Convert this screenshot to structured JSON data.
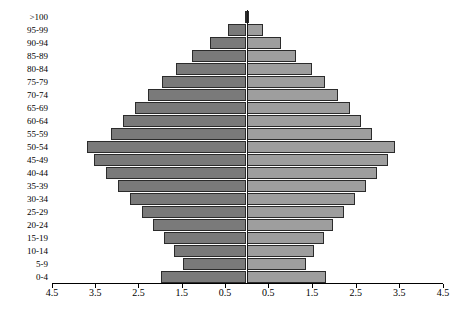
{
  "chart_data": {
    "type": "bar",
    "subtype": "population-pyramid",
    "title": "",
    "xlabel": "",
    "ylabel": "",
    "orientation": "horizontal",
    "grid": false,
    "legend": null,
    "axis": {
      "center_value": 0,
      "half_range": 4.5,
      "xticks_left": [
        "4.5",
        "3.5",
        "2.5",
        "1.5",
        "0.5"
      ],
      "xticks_right": [
        "0.5",
        "1.5",
        "2.5",
        "3.5",
        "4.5"
      ],
      "xtick_values_left": [
        4.5,
        3.5,
        2.5,
        1.5,
        0.5
      ],
      "xtick_values_right": [
        0.5,
        1.5,
        2.5,
        3.5,
        4.5
      ],
      "xlim": [
        -4.5,
        4.5
      ]
    },
    "categories": [
      ">100",
      "95-99",
      "90-94",
      "85-89",
      "80-84",
      "75-79",
      "70-74",
      "65-69",
      "60-64",
      "55-59",
      "50-54",
      "45-49",
      "40-44",
      "35-39",
      "30-34",
      "25-29",
      "20-24",
      "15-19",
      "10-14",
      "5-9",
      "0-4"
    ],
    "series": [
      {
        "name": "left",
        "side": "left",
        "color": "#7a7a7a",
        "values": [
          0.04,
          0.42,
          0.85,
          1.25,
          1.62,
          1.96,
          2.29,
          2.58,
          2.86,
          3.14,
          3.7,
          3.52,
          3.25,
          2.97,
          2.7,
          2.42,
          2.16,
          1.92,
          1.68,
          1.48,
          1.98
        ]
      },
      {
        "name": "right",
        "side": "right",
        "color": "#9e9e9e",
        "values": [
          0.04,
          0.38,
          0.78,
          1.14,
          1.49,
          1.8,
          2.1,
          2.37,
          2.63,
          2.88,
          3.4,
          3.23,
          2.98,
          2.73,
          2.48,
          2.23,
          1.99,
          1.77,
          1.55,
          1.37,
          1.83
        ]
      }
    ]
  },
  "style": {
    "bar_border_color": "#2b2b2b",
    "axis_color": "#000000",
    "center_line_color": "#1a1a1a",
    "background": "#ffffff"
  }
}
